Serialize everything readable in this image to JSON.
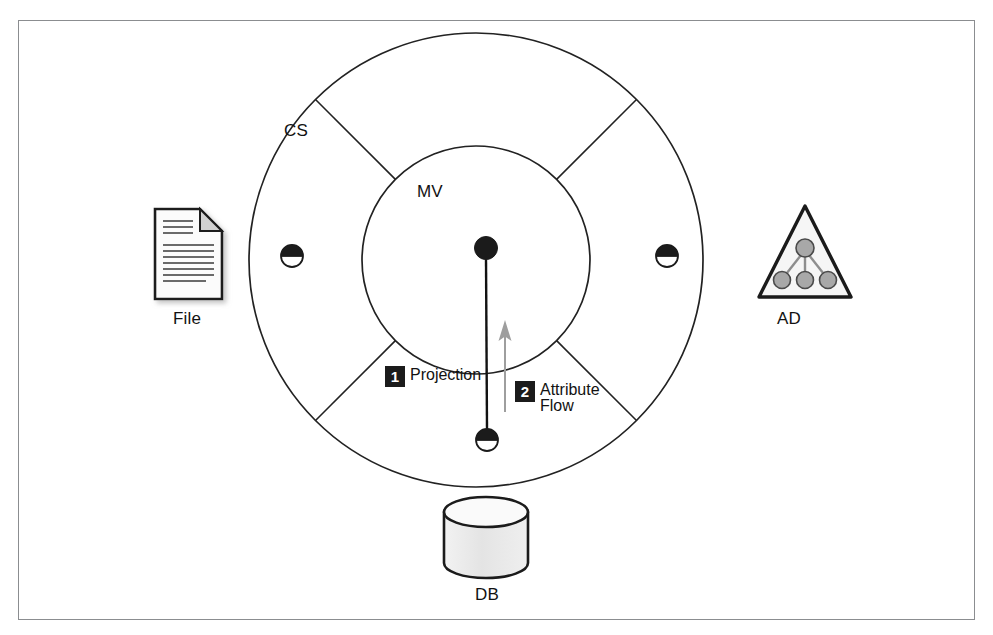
{
  "figure": {
    "frame_color": "#8b8d90",
    "background_color": "#ffffff",
    "ink_color": "#121212",
    "badge_color": "#1b1b1b",
    "arrow_color": "#9a9a9a",
    "icon_fill": "#e8e8e8"
  },
  "rings": {
    "outer": {
      "label": "CS",
      "name": "connector-space-ring",
      "center_x": 476,
      "center_y": 260,
      "radius": 227
    },
    "inner": {
      "label": "MV",
      "name": "metaverse-circle",
      "center_x": 476,
      "center_y": 260,
      "radius": 114
    },
    "spoke_angles_deg": [
      45,
      135,
      225,
      315
    ]
  },
  "nodes": {
    "metaverse_object": {
      "name": "metaverse-object",
      "x": 486,
      "y": 248,
      "radius": 11
    },
    "connectors": [
      {
        "name": "connector-space-object-left",
        "x": 292,
        "y": 256,
        "radius": 11
      },
      {
        "name": "connector-space-object-right",
        "x": 667,
        "y": 256,
        "radius": 11
      },
      {
        "name": "connector-space-object-bottom",
        "x": 487,
        "y": 440,
        "radius": 11
      }
    ]
  },
  "flows": {
    "projection_line": {
      "from_x": 486,
      "from_y": 260,
      "to_x": 487,
      "to_y": 429,
      "color": "#121212"
    },
    "attribute_flow_arrow": {
      "from_x": 505,
      "from_y": 412,
      "to_x": 505,
      "to_y": 322,
      "color": "#9a9a9a",
      "direction": "up"
    }
  },
  "callouts": [
    {
      "number": "1",
      "label": "Projection",
      "name": "callout-projection"
    },
    {
      "number": "2",
      "label": "Attribute Flow",
      "name": "callout-attribute-flow"
    }
  ],
  "sources": [
    {
      "name": "file-source",
      "label": "File",
      "icon": "document-icon"
    },
    {
      "name": "active-directory-source",
      "label": "AD",
      "icon": "triangle-tree-icon"
    },
    {
      "name": "database-source",
      "label": "DB",
      "icon": "database-cylinder-icon"
    }
  ]
}
